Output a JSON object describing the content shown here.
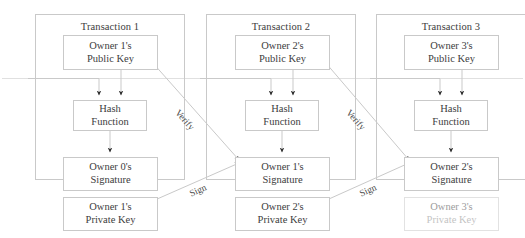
{
  "diagram": {
    "colors": {
      "box_border": "#c9c9c9",
      "line": "#c9c9c9",
      "arrowhead": "#2b2b2b",
      "text": "#3d3d3d",
      "background": "#ffffff"
    },
    "transactions": [
      {
        "group_label": "Transaction 1",
        "public_key": {
          "line1": "Owner 1's",
          "line2": "Public Key"
        },
        "hash_function": {
          "line1": "Hash",
          "line2": "Function"
        },
        "signature": {
          "line1": "Owner 0's",
          "line2": "Signature"
        },
        "private_key": {
          "line1": "Owner 1's",
          "line2": "Private Key"
        }
      },
      {
        "group_label": "Transaction 2",
        "public_key": {
          "line1": "Owner 2's",
          "line2": "Public Key"
        },
        "hash_function": {
          "line1": "Hash",
          "line2": "Function"
        },
        "signature": {
          "line1": "Owner 1's",
          "line2": "Signature"
        },
        "private_key": {
          "line1": "Owner 2's",
          "line2": "Private Key"
        }
      },
      {
        "group_label": "Transaction 3",
        "public_key": {
          "line1": "Owner 3's",
          "line2": "Public Key"
        },
        "hash_function": {
          "line1": "Hash",
          "line2": "Function"
        },
        "signature": {
          "line1": "Owner 2's",
          "line2": "Signature"
        },
        "private_key": {
          "line1": "Owner 3's",
          "line2": "Private Key"
        }
      }
    ],
    "edge_labels": {
      "verify_1": "Verify",
      "verify_2": "Verify",
      "sign_1": "Sign",
      "sign_2": "Sign"
    }
  }
}
